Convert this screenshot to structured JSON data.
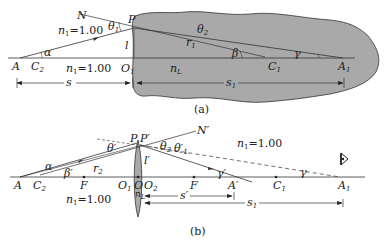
{
  "colors": {
    "medium_fill": "#a9a9a9",
    "lens_fill": "#a9a9a9",
    "line": "#333333",
    "background": "#ffffff"
  },
  "panel_a": {
    "caption": "(a)",
    "labels": {
      "N": "N",
      "P": "P",
      "theta1": "θ",
      "theta1_sub": "1",
      "theta2": "θ",
      "theta2_sub": "2",
      "n1_top": "n",
      "n1_top_sub": "1",
      "n1_top_val": "=1.00",
      "alpha": "α",
      "l": "l",
      "r1": "r",
      "r1_sub": "1",
      "beta": "β",
      "gamma": "γ",
      "A": "A",
      "C2": "C",
      "C2_sub": "2",
      "n1_axis": "n",
      "n1_axis_sub": "1",
      "n1_axis_val": "=1.00",
      "O1": "O",
      "O1_sub": "1",
      "nL": "n",
      "nL_sub": "L",
      "C1": "C",
      "C1_sub": "1",
      "A1": "A",
      "A1_sub": "1",
      "s": "s",
      "s1": "s",
      "s1_sub": "1"
    }
  },
  "panel_b": {
    "caption": "(b)",
    "labels": {
      "N_prime": "N′",
      "P": "P",
      "P_prime": "P′",
      "theta_prime": "θ′",
      "theta2": "θ",
      "theta2_sub": "2",
      "theta1_prime": "θ′",
      "theta1_prime_sub": "1",
      "n1_top": "n",
      "n1_top_sub": "1",
      "n1_top_val": "=1.00",
      "alpha": "α",
      "beta_prime": "β′",
      "r2": "r",
      "r2_sub": "2",
      "l_prime": "l′",
      "gamma_prime": "γ′",
      "gamma": "γ",
      "A": "A",
      "C2": "C",
      "C2_sub": "2",
      "F_left": "F",
      "O1": "O",
      "O1_sub": "1",
      "O": "O",
      "O2": "O",
      "O2_sub": "2",
      "F_right": "F",
      "A_prime": "A′",
      "C1": "C",
      "C1_sub": "1",
      "A1": "A",
      "A1_sub": "1",
      "nL": "n",
      "nL_sub": "L",
      "n1_axis": "n",
      "n1_axis_sub": "1",
      "n1_axis_val": "=1.00",
      "s_prime": "s′",
      "s1": "s",
      "s1_sub": "1"
    }
  }
}
